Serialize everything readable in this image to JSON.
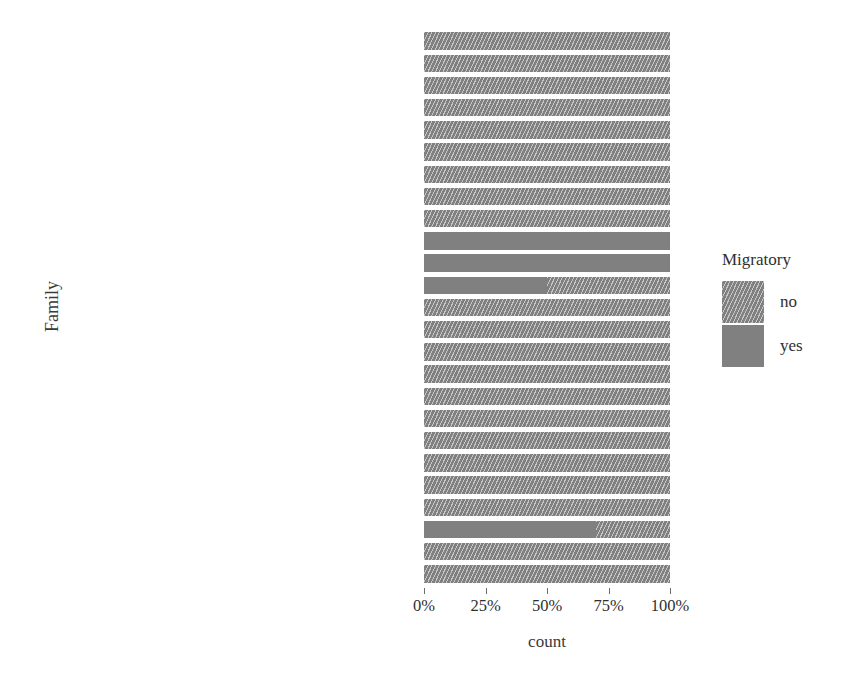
{
  "chart_data": {
    "type": "bar",
    "orientation": "horizontal",
    "stacked": true,
    "normalized": true,
    "title": "",
    "xlabel": "count",
    "ylabel": "Family",
    "xlim": [
      0,
      100
    ],
    "xtick_labels": [
      "0%",
      "25%",
      "50%",
      "75%",
      "100%"
    ],
    "xtick_values": [
      0,
      25,
      50,
      75,
      100
    ],
    "grid": false,
    "legend": {
      "title": "Migratory",
      "position": "right",
      "entries": [
        {
          "label": "no",
          "pattern": "hatched",
          "color": "#808080"
        },
        {
          "label": "yes",
          "pattern": "solid",
          "color": "#808080"
        }
      ]
    },
    "categories": [
      "unclassified Lepidoptera",
      "unclassified Insecta",
      "unclassified Diptera",
      "unclassified Arthropoda",
      "Tortricidae",
      "Tipulidae",
      "Pyralidae",
      "Nolidae",
      "Noctuidae/ Gelechiidae/ Noctuidae",
      "Noctuidae/ Crambidae",
      "Noctuidae / Geometridae / Tortricidae",
      "Noctuidae",
      "Lygaeidae",
      "Lycaenidae",
      "Hemerobiidae",
      "Geometridae",
      "Gelechiidae/ Geometridae",
      "Gelechiidae",
      "Erebidae",
      "Depressariidae",
      "Curculionidae",
      "Culicidae",
      "Crambidae",
      "Chrysopidae",
      "Carabidae"
    ],
    "series": [
      {
        "name": "yes",
        "values": [
          0,
          0,
          0,
          0,
          0,
          0,
          0,
          0,
          0,
          100,
          100,
          50,
          0,
          0,
          0,
          0,
          0,
          0,
          0,
          0,
          0,
          0,
          70,
          0,
          0
        ]
      },
      {
        "name": "no",
        "values": [
          100,
          100,
          100,
          100,
          100,
          100,
          100,
          100,
          100,
          0,
          0,
          50,
          100,
          100,
          100,
          100,
          100,
          100,
          100,
          100,
          100,
          100,
          30,
          100,
          100
        ]
      }
    ]
  }
}
